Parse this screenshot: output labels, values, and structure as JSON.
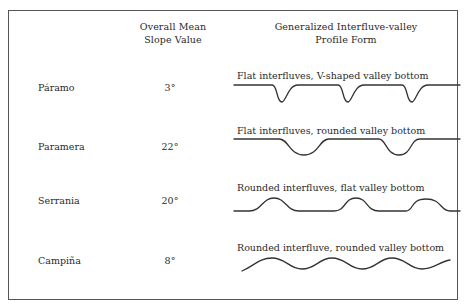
{
  "table": {
    "headers": {
      "slope": [
        "Overall Mean",
        "Slope Value"
      ],
      "profile": [
        "Generalized Interfluve-valley",
        "Profile Form"
      ]
    },
    "rows": [
      {
        "landform": "Páramo",
        "slope": "3°",
        "profile_caption": "Flat interfluves, V-shaped valley bottom",
        "profile_shape": "flat-interfluve-v-valley"
      },
      {
        "landform": "Paramera",
        "slope": "22°",
        "profile_caption": "Flat interfluves, rounded valley bottom",
        "profile_shape": "flat-interfluve-rounded-valley"
      },
      {
        "landform": "Serrania",
        "slope": "20°",
        "profile_caption": "Rounded interfluves, flat valley bottom",
        "profile_shape": "rounded-interfluve-flat-valley"
      },
      {
        "landform": "Campiña",
        "slope": "8°",
        "profile_caption": "Rounded interfluve, rounded valley bottom",
        "profile_shape": "rounded-interfluve-rounded-valley"
      }
    ]
  }
}
